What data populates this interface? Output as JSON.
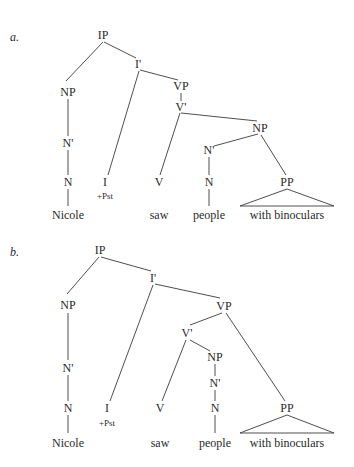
{
  "figure": {
    "colors": {
      "background": "#ffffff",
      "text": "#2a2a2a",
      "line": "#3a3a3a"
    },
    "trees": [
      {
        "id": "a",
        "letter": "a.",
        "letter_pos": [
          10,
          37
        ],
        "sentence": "Nicole +Pst saw people with binoculars",
        "reading": "PP attached inside object NP (people who have binoculars)",
        "nodes": [
          {
            "id": "IP",
            "label": "IP",
            "x": 103,
            "y": 35
          },
          {
            "id": "NP1",
            "label": "NP",
            "x": 68,
            "y": 92
          },
          {
            "id": "Nb1",
            "label": "N'",
            "x": 68,
            "y": 143
          },
          {
            "id": "N1",
            "label": "N",
            "x": 68,
            "y": 182
          },
          {
            "id": "W1",
            "label": "Nicole",
            "x": 68,
            "y": 215
          },
          {
            "id": "Ib",
            "label": "I'",
            "x": 138,
            "y": 64
          },
          {
            "id": "I",
            "label": "I",
            "x": 105,
            "y": 182
          },
          {
            "id": "Pst",
            "label": "+Pst",
            "x": 105,
            "y": 196,
            "small": true
          },
          {
            "id": "VP",
            "label": "VP",
            "x": 181,
            "y": 86
          },
          {
            "id": "Vb",
            "label": "V'",
            "x": 181,
            "y": 107
          },
          {
            "id": "V",
            "label": "V",
            "x": 159,
            "y": 182
          },
          {
            "id": "W2",
            "label": "saw",
            "x": 159,
            "y": 215
          },
          {
            "id": "NP2",
            "label": "NP",
            "x": 260,
            "y": 128
          },
          {
            "id": "Nb2",
            "label": "N'",
            "x": 209,
            "y": 150
          },
          {
            "id": "N2",
            "label": "N",
            "x": 209,
            "y": 182
          },
          {
            "id": "W3",
            "label": "people",
            "x": 209,
            "y": 215
          },
          {
            "id": "PP",
            "label": "PP",
            "x": 287,
            "y": 182
          },
          {
            "id": "W4",
            "label": "with binoculars",
            "x": 287,
            "y": 215
          }
        ],
        "edges": [
          [
            103,
            42,
            66,
            81
          ],
          [
            104,
            42,
            136,
            58
          ],
          [
            68,
            99,
            68,
            136
          ],
          [
            68,
            150,
            68,
            175
          ],
          [
            68,
            189,
            68,
            206
          ],
          [
            139,
            71,
            108,
            175
          ],
          [
            140,
            70,
            178,
            80
          ],
          [
            181,
            93,
            181,
            101
          ],
          [
            180,
            113,
            160,
            175
          ],
          [
            181,
            113,
            257,
            121
          ],
          [
            258,
            134,
            214,
            146
          ],
          [
            261,
            135,
            286,
            175
          ],
          [
            209,
            157,
            209,
            175
          ],
          [
            209,
            189,
            209,
            206
          ]
        ],
        "triangles": [
          [
            [
              287,
              189
            ],
            [
              240,
              206
            ],
            [
              334,
              206
            ]
          ]
        ]
      },
      {
        "id": "b",
        "letter": "b.",
        "letter_pos": [
          10,
          252
        ],
        "sentence": "Nicole +Pst saw people with binoculars",
        "reading": "PP attached to VP (seeing by means of binoculars)",
        "nodes": [
          {
            "id": "IP",
            "label": "IP",
            "x": 100,
            "y": 250
          },
          {
            "id": "NP1",
            "label": "NP",
            "x": 68,
            "y": 305
          },
          {
            "id": "Nb1",
            "label": "N'",
            "x": 68,
            "y": 368
          },
          {
            "id": "N1",
            "label": "N",
            "x": 68,
            "y": 408
          },
          {
            "id": "W1",
            "label": "Nicole",
            "x": 68,
            "y": 443
          },
          {
            "id": "Ib",
            "label": "I'",
            "x": 153,
            "y": 278
          },
          {
            "id": "I",
            "label": "I",
            "x": 107,
            "y": 408
          },
          {
            "id": "Pst",
            "label": "+Pst",
            "x": 107,
            "y": 423,
            "small": true
          },
          {
            "id": "VP",
            "label": "VP",
            "x": 224,
            "y": 306
          },
          {
            "id": "Vb",
            "label": "V'",
            "x": 187,
            "y": 333
          },
          {
            "id": "V",
            "label": "V",
            "x": 160,
            "y": 408
          },
          {
            "id": "W2",
            "label": "saw",
            "x": 160,
            "y": 443
          },
          {
            "id": "NP2",
            "label": "NP",
            "x": 215,
            "y": 357
          },
          {
            "id": "Nb2",
            "label": "N'",
            "x": 215,
            "y": 383
          },
          {
            "id": "N2",
            "label": "N",
            "x": 215,
            "y": 408
          },
          {
            "id": "W3",
            "label": "people",
            "x": 215,
            "y": 443
          },
          {
            "id": "PP",
            "label": "PP",
            "x": 287,
            "y": 408
          },
          {
            "id": "W4",
            "label": "with binoculars",
            "x": 287,
            "y": 443
          }
        ],
        "edges": [
          [
            99,
            257,
            67,
            294
          ],
          [
            101,
            257,
            151,
            271
          ],
          [
            68,
            313,
            68,
            360
          ],
          [
            68,
            375,
            68,
            401
          ],
          [
            68,
            415,
            68,
            433
          ],
          [
            153,
            285,
            110,
            401
          ],
          [
            155,
            284,
            220,
            298
          ],
          [
            222,
            313,
            190,
            325
          ],
          [
            226,
            313,
            285,
            401
          ],
          [
            186,
            340,
            162,
            401
          ],
          [
            190,
            340,
            210,
            351
          ],
          [
            215,
            364,
            215,
            376
          ],
          [
            215,
            390,
            215,
            401
          ],
          [
            215,
            415,
            215,
            433
          ]
        ],
        "triangles": [
          [
            [
              287,
              415
            ],
            [
              240,
              433
            ],
            [
              334,
              433
            ]
          ]
        ]
      }
    ]
  }
}
